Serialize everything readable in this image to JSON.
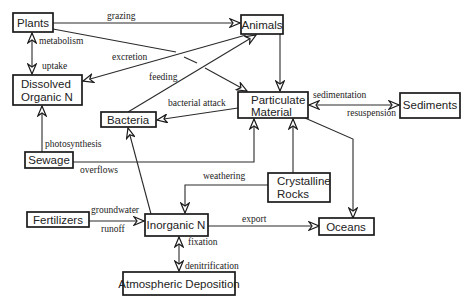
{
  "diagram": {
    "nodes": {
      "plants": {
        "lines": [
          "Plants"
        ]
      },
      "animals": {
        "lines": [
          "Animals"
        ]
      },
      "dissolved_organic_n": {
        "lines": [
          "Dissolved",
          "Organic N"
        ]
      },
      "bacteria": {
        "lines": [
          "Bacteria"
        ]
      },
      "particulate_material": {
        "lines": [
          "Particulate",
          "Material"
        ]
      },
      "sediments": {
        "lines": [
          "Sediments"
        ]
      },
      "sewage": {
        "lines": [
          "Sewage"
        ]
      },
      "crystalline_rocks": {
        "lines": [
          "Crystalline",
          "Rocks"
        ]
      },
      "fertilizers": {
        "lines": [
          "Fertilizers"
        ]
      },
      "inorganic_n": {
        "lines": [
          "Inorganic N"
        ]
      },
      "oceans": {
        "lines": [
          "Oceans"
        ]
      },
      "atmospheric_deposition": {
        "lines": [
          "Atmospheric Deposition"
        ]
      }
    },
    "edges": [
      {
        "from": "Plants",
        "to": "Animals",
        "labels": [
          "grazing"
        ],
        "direction": "forward"
      },
      {
        "from": "Plants",
        "to": "Dissolved Organic N",
        "labels": [
          "metabolism",
          "uptake"
        ],
        "direction": "both"
      },
      {
        "from": "Animals",
        "to": "Dissolved Organic N",
        "labels": [
          "excretion"
        ],
        "direction": "forward"
      },
      {
        "from": "Plants",
        "to": "Particulate Material",
        "labels": [],
        "direction": "forward"
      },
      {
        "from": "Bacteria",
        "to": "Animals",
        "labels": [
          "feeding"
        ],
        "direction": "forward"
      },
      {
        "from": "Animals",
        "to": "Particulate Material",
        "labels": [],
        "direction": "forward"
      },
      {
        "from": "Particulate Material",
        "to": "Bacteria",
        "labels": [
          "bacterial attack"
        ],
        "direction": "forward"
      },
      {
        "from": "Particulate Material",
        "to": "Sediments",
        "labels": [
          "sedimentation",
          "resuspension"
        ],
        "direction": "both"
      },
      {
        "from": "Sewage",
        "to": "Dissolved Organic N",
        "labels": [
          "photosynthesis"
        ],
        "direction": "forward"
      },
      {
        "from": "Sewage",
        "to": "Particulate Material",
        "labels": [
          "overflows"
        ],
        "direction": "forward"
      },
      {
        "from": "Crystalline Rocks",
        "to": "Particulate Material",
        "labels": [],
        "direction": "forward"
      },
      {
        "from": "Crystalline Rocks",
        "to": "Inorganic N",
        "labels": [
          "weathering"
        ],
        "direction": "forward"
      },
      {
        "from": "Particulate Material",
        "to": "Oceans",
        "labels": [],
        "direction": "forward"
      },
      {
        "from": "Inorganic N",
        "to": "Bacteria",
        "labels": [],
        "direction": "forward"
      },
      {
        "from": "Fertilizers",
        "to": "Inorganic N",
        "labels": [
          "groundwater",
          "runoff"
        ],
        "direction": "forward"
      },
      {
        "from": "Inorganic N",
        "to": "Oceans",
        "labels": [
          "export"
        ],
        "direction": "forward"
      },
      {
        "from": "Inorganic N",
        "to": "Atmospheric Deposition",
        "labels": [
          "fixation",
          "denitrification"
        ],
        "direction": "both"
      }
    ]
  }
}
